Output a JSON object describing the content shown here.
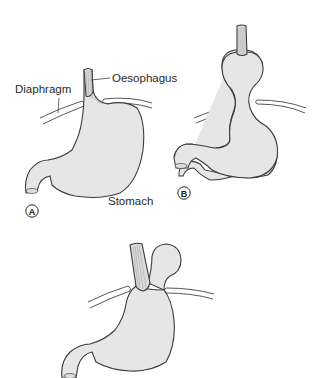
{
  "figure": {
    "labels": {
      "diaphragm": "Diaphragm",
      "oesophagus": "Oesophagus",
      "stomach": "Stomach"
    },
    "panels": [
      {
        "id": "A",
        "badge": "A",
        "title": "Normal anatomy"
      },
      {
        "id": "B",
        "badge": "B",
        "title": "Sliding hiatus hernia"
      },
      {
        "id": "C",
        "badge": "",
        "title": "Rolling (para-oesophageal) hiatus hernia"
      }
    ],
    "colors": {
      "fill": "#e6e6e6",
      "outline": "#3a3a3a",
      "text": "#2a2a2a"
    }
  }
}
